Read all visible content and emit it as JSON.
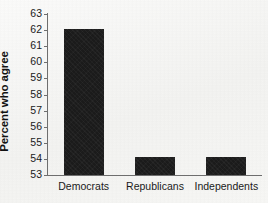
{
  "chart_data": {
    "type": "bar",
    "title": "",
    "subtitle": "",
    "xlabel": "",
    "ylabel": "Percent who agree",
    "categories": [
      "Democrats",
      "Republicans",
      "Independents"
    ],
    "values": [
      62.1,
      54.1,
      54.1
    ],
    "ylim": [
      53,
      63
    ],
    "yticks": [
      53,
      54,
      55,
      56,
      57,
      58,
      59,
      60,
      61,
      62,
      63
    ],
    "ytick_labels": [
      "53",
      "54",
      "55",
      "56",
      "57",
      "58",
      "59",
      "60",
      "61",
      "62",
      "63"
    ],
    "grid": false,
    "legend": null,
    "legend_position": "none",
    "series": [
      {
        "name": "Percent who agree",
        "values": [
          62.1,
          54.1,
          54.1
        ]
      }
    ],
    "annotations": [],
    "colors": {
      "bar": "#1b1b1b",
      "axis": "#6e6e6e",
      "text": "#1a1a1a",
      "background": "#f6f6f4"
    }
  }
}
